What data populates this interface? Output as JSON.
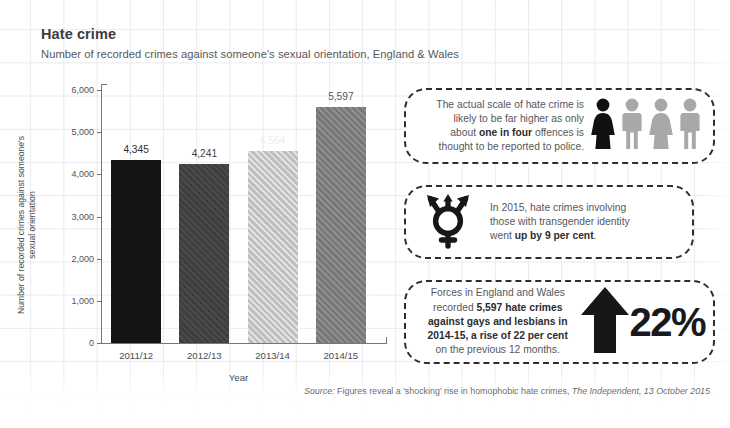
{
  "header": {
    "title": "Hate crime",
    "subtitle": "Number of recorded crimes against someone's sexual orientation, England & Wales"
  },
  "chart_data": {
    "type": "bar",
    "title": "Hate crime",
    "subtitle": "Number of recorded crimes against someone's sexual orientation, England & Wales",
    "categories": [
      "2011/12",
      "2012/13",
      "2013/14",
      "2014/15"
    ],
    "values": [
      4345,
      4241,
      4564,
      5597
    ],
    "data_labels": [
      "4,345",
      "4,241",
      "4,564",
      "5,597"
    ],
    "xlabel": "Year",
    "ylabel": "Number of recorded crimes against someone's sexual orientation",
    "ylim": [
      0,
      6000
    ],
    "ytick_values": [
      0,
      1000,
      2000,
      3000,
      4000,
      5000,
      6000
    ],
    "ytick_labels": [
      "0",
      "1,000",
      "2,000",
      "3,000",
      "4,000",
      "5,000",
      "6,000"
    ],
    "grid": true,
    "legend": "none",
    "bar_styles": [
      {
        "fill": "#141414",
        "pattern": "solid",
        "label_color": "#2b2d30"
      },
      {
        "fill": "#4a4a4a",
        "pattern": "diagonal-stripe",
        "label_color": "#3f4145"
      },
      {
        "fill": "#e2e2e2",
        "pattern": "diagonal-stripe",
        "label_color": "#ededed"
      },
      {
        "fill": "#8e8e8e",
        "pattern": "diagonal-stripe",
        "label_color": "#55585d"
      }
    ]
  },
  "callouts": [
    {
      "id": "reporting-rate",
      "text_parts": {
        "line1": "The actual scale of hate crime is",
        "line2": "likely to be far higher as only",
        "line3_a": "about ",
        "line3_bold": "one in four",
        "line3_b": " offences is",
        "line4": "thought to be reported to police."
      },
      "icon": "four-people-icon",
      "people": [
        {
          "name": "person-female-highlight-icon",
          "color": "#111111",
          "type": "female"
        },
        {
          "name": "person-male-muted-icon",
          "color": "#a8a8a8",
          "type": "male"
        },
        {
          "name": "person-female-muted-icon",
          "color": "#a8a8a8",
          "type": "female"
        },
        {
          "name": "person-male-muted-icon",
          "color": "#a8a8a8",
          "type": "male"
        }
      ]
    },
    {
      "id": "transgender-rise",
      "text_parts": {
        "line1": "In 2015, hate crimes involving",
        "line2": "those with transgender identity",
        "line3_a": "went ",
        "line3_bold": "up by 9 per cent",
        "line3_b": "."
      },
      "icon": "transgender-symbol-icon"
    },
    {
      "id": "annual-rise",
      "text_parts": {
        "line1": "Forces in England and Wales",
        "line2_a": "recorded ",
        "line2_bold": "5,597 hate crimes",
        "line3_bold": "against gays and lesbians in",
        "line4_bold": "2014-15, a rise of 22 per cent",
        "line5": "on the previous 12 months."
      },
      "icon": "up-arrow-icon",
      "percent_value": "22%"
    }
  ],
  "source": {
    "prefix": "Source:",
    "text": " Figures reveal a 'shocking' rise in homophobic hate crimes,",
    "publication": " The Independent,",
    "date": " 13 October 2015"
  }
}
